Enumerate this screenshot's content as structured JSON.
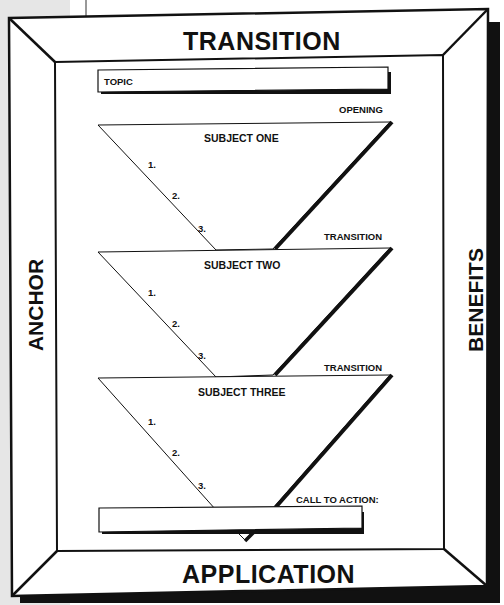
{
  "frame": {
    "top_label": "TRANSITION",
    "bottom_label": "APPLICATION",
    "left_label": "ANCHOR",
    "right_label": "BENEFITS"
  },
  "topic": {
    "label": "TOPIC"
  },
  "opening_label": "OPENING",
  "subjects": [
    {
      "title": "SUBJECT ONE",
      "points": [
        "1.",
        "2.",
        "3."
      ]
    },
    {
      "title": "SUBJECT TWO",
      "points": [
        "1.",
        "2.",
        "3."
      ],
      "transition_label": "TRANSITION"
    },
    {
      "title": "SUBJECT THREE",
      "points": [
        "1.",
        "2.",
        "3."
      ],
      "transition_label": "TRANSITION"
    }
  ],
  "call_to_action": {
    "label": "CALL TO ACTION:"
  },
  "colors": {
    "line": "#111111",
    "background": "#ffffff",
    "margin_gray": "#e6e6e6"
  }
}
